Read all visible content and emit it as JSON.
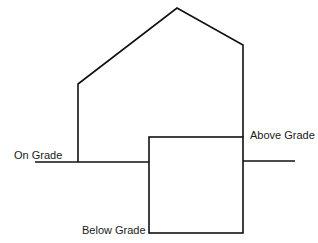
{
  "diagram": {
    "type": "building-section",
    "stroke_color": "#111111",
    "background": "#ffffff",
    "labels": {
      "on_grade": "On Grade",
      "above_grade": "Above Grade",
      "below_grade": "Below Grade"
    },
    "elements": [
      {
        "name": "house-outline",
        "description": "Gabled house profile above grade line"
      },
      {
        "name": "grade-line",
        "description": "Horizontal ground level line"
      },
      {
        "name": "basement-box",
        "description": "Rectangle extending above and below grade"
      }
    ]
  }
}
